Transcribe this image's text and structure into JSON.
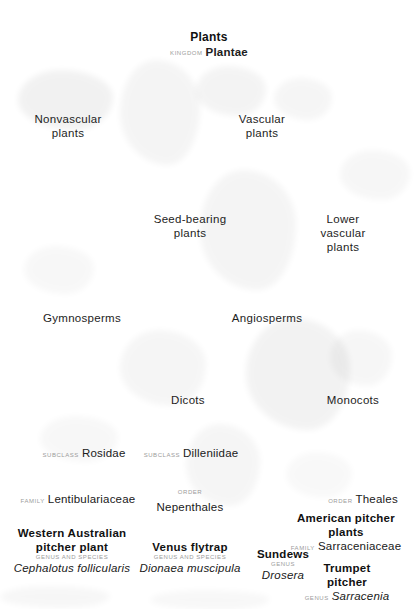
{
  "diagram": {
    "type": "taxonomic-hierarchy",
    "background_color": "#ffffff",
    "text_color": "#111111",
    "rank_label_color": "#9b9b9b"
  },
  "ranks": {
    "kingdom": "KINGDOM",
    "subclass": "SUBCLASS",
    "family": "FAMILY",
    "order": "ORDER",
    "genus": "GENUS",
    "genus_and_species": "GENUS AND SPECIES"
  },
  "nodes": {
    "root": {
      "common_name": "Plants",
      "rank": "KINGDOM",
      "scientific_name": "Plantae"
    },
    "nonvascular": {
      "common_name": "Nonvascular\nplants"
    },
    "vascular": {
      "common_name": "Vascular\nplants"
    },
    "seed_bearing": {
      "common_name": "Seed-bearing\nplants"
    },
    "lower_vascular": {
      "common_name": "Lower vascular\nplants"
    },
    "gymnosperms": {
      "common_name": "Gymnosperms"
    },
    "angiosperms": {
      "common_name": "Angiosperms"
    },
    "dicots": {
      "common_name": "Dicots"
    },
    "monocots": {
      "common_name": "Monocots"
    },
    "rosidae": {
      "rank": "SUBCLASS",
      "scientific_name": "Rosidae"
    },
    "dilleniidae": {
      "rank": "SUBCLASS",
      "scientific_name": "Dilleniidae"
    },
    "lentibulariaceae": {
      "rank": "FAMILY",
      "scientific_name": "Lentibulariaceae"
    },
    "nepenthales": {
      "rank": "ORDER",
      "scientific_name": "Nepenthales"
    },
    "theales": {
      "rank": "ORDER",
      "scientific_name": "Theales"
    },
    "cephalotus": {
      "common_name": "Western Australian\npitcher plant",
      "rank": "GENUS AND SPECIES",
      "scientific_name": "Cephalotus follicularis"
    },
    "dionaea": {
      "common_name": "Venus flytrap",
      "rank": "GENUS AND SPECIES",
      "scientific_name": "Dionaea muscipula"
    },
    "drosera": {
      "common_name": "Sundews",
      "rank": "GENUS",
      "scientific_name": "Drosera"
    },
    "american_pitcher": {
      "common_name": "American pitcher\nplants",
      "rank": "FAMILY",
      "scientific_name": "Sarraceniaceae"
    },
    "sarracenia": {
      "common_name": "Trumpet pitcher",
      "rank": "GENUS",
      "scientific_name": "Sarracenia"
    }
  }
}
